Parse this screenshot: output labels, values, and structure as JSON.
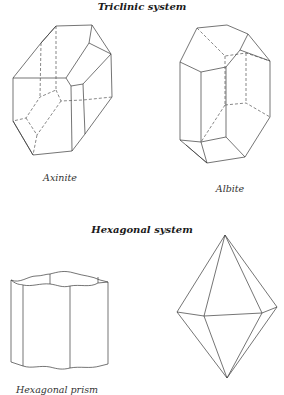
{
  "sections": [
    {
      "title": "Triclinic system",
      "figures": [
        {
          "label": "Axinite"
        },
        {
          "label": "Albite"
        }
      ]
    },
    {
      "title": "Hexagonal system",
      "figures": [
        {
          "label": "Hexagonal prism"
        },
        {
          "label": ""
        }
      ]
    }
  ],
  "colors": {
    "line": "#3a3a3a",
    "background": "#ffffff"
  }
}
